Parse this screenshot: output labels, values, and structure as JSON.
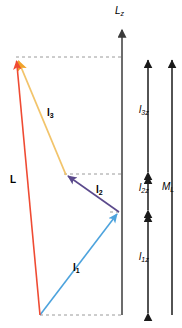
{
  "figure": {
    "background": "#ffffff"
  },
  "vectors": [
    {
      "id": "l1",
      "label": "l",
      "subscript": "1",
      "color": "#4da3dd",
      "x1": 40,
      "y1": 315,
      "x2": 119,
      "y2": 212,
      "label_x": 73,
      "label_y": 268
    },
    {
      "id": "l2",
      "label": "l",
      "subscript": "2",
      "color": "#5b4a8c",
      "x1": 119,
      "y1": 212,
      "x2": 66,
      "y2": 175,
      "label_x": 96,
      "label_y": 190
    },
    {
      "id": "l3",
      "label": "l",
      "subscript": "3",
      "color": "#f2c46b",
      "x1": 66,
      "y1": 175,
      "x2": 17,
      "y2": 58,
      "label_x": 47,
      "label_y": 113
    },
    {
      "id": "L",
      "label": "L",
      "subscript": "",
      "color": "#ef4b33",
      "x1": 40,
      "y1": 315,
      "x2": 16,
      "y2": 57,
      "label_x": 11,
      "label_y": 180
    }
  ],
  "axes": [
    {
      "id": "Lz",
      "label": "L",
      "subscript": "z",
      "color": "#3b3b3b",
      "x": 122,
      "y_top": 28,
      "y_bottom": 315,
      "label_x": 116,
      "label_y": 8,
      "arrow": "up"
    }
  ],
  "measures": [
    {
      "id": "l3z",
      "label": "l",
      "subscript": "3z",
      "color": "#1a1a1a",
      "x": 148,
      "y_top": 57,
      "y_bottom": 174,
      "label_x": 140,
      "label_y": 110,
      "arrows": "both"
    },
    {
      "id": "l2z",
      "label": "l",
      "subscript": "2z",
      "color": "#1a1a1a",
      "x": 148,
      "y_top": 174,
      "y_bottom": 212,
      "label_x": 140,
      "label_y": 187,
      "arrows": "both"
    },
    {
      "id": "l1z",
      "label": "l",
      "subscript": "1z",
      "color": "#1a1a1a",
      "x": 148,
      "y_top": 212,
      "y_bottom": 315,
      "label_x": 140,
      "label_y": 257,
      "arrows": "both"
    },
    {
      "id": "ML",
      "label": "M",
      "subscript": "L",
      "color": "#1a1a1a",
      "x": 172,
      "y_top": 57,
      "y_bottom": 315,
      "label_x": 164,
      "label_y": 186,
      "arrows": "up"
    }
  ],
  "guides": [
    {
      "id": "guide-top",
      "x1": 16,
      "x2": 122,
      "y": 57
    },
    {
      "id": "guide-mid",
      "x1": 64,
      "x2": 122,
      "y": 174
    },
    {
      "id": "guide-lower",
      "x1": 110,
      "x2": 122,
      "y": 212
    },
    {
      "id": "guide-bottom",
      "x1": 40,
      "x2": 122,
      "y": 315
    }
  ],
  "guide_style": {
    "color": "#9a9a9a",
    "dash": "3 3",
    "width": 1
  }
}
